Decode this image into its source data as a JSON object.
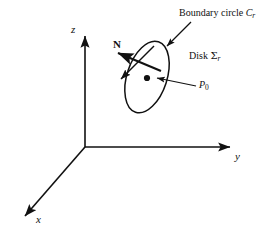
{
  "figure": {
    "background_color": "#ffffff",
    "stroke_color": "#111111"
  },
  "axes": {
    "origin": {
      "x": 85,
      "y": 147
    },
    "items": [
      {
        "name": "z-axis",
        "label": "z",
        "tip": {
          "x": 85,
          "y": 33
        }
      },
      {
        "name": "y-axis",
        "label": "y",
        "tip": {
          "x": 233,
          "y": 147
        }
      },
      {
        "name": "x-axis",
        "label": "x",
        "tip": {
          "x": 22,
          "y": 219
        }
      }
    ]
  },
  "labels": {
    "boundary_circle": {
      "text_prefix": "Boundary circle ",
      "symbol": "C",
      "subscript": "r"
    },
    "disk": {
      "text_prefix": "Disk ",
      "symbol": "Σ",
      "subscript": "r"
    },
    "point": {
      "symbol": "P",
      "subscript": "0"
    },
    "normal_vector": {
      "symbol": "N"
    }
  },
  "shapes": {
    "disk_ellipse": {
      "center": {
        "x": 147,
        "y": 77
      },
      "radius_major": 37,
      "radius_minor": 20,
      "rotation_deg": -72
    },
    "center_point": {
      "x": 147,
      "y": 78
    },
    "normal_arrow": {
      "from": {
        "x": 160,
        "y": 70
      },
      "to": {
        "x": 116,
        "y": 52
      }
    },
    "back_arrow": {
      "from": {
        "x": 152,
        "y": 48
      },
      "to": {
        "x": 120,
        "y": 80
      }
    },
    "leader_boundary": {
      "from": {
        "x": 190,
        "y": 22
      },
      "to": {
        "x": 166,
        "y": 46
      }
    },
    "leader_point": {
      "from": {
        "x": 196,
        "y": 86
      },
      "to": {
        "x": 156,
        "y": 78
      }
    }
  }
}
